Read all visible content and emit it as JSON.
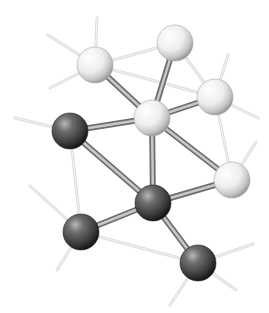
{
  "image": {
    "description": "3D ball-and-stick molecular cluster illustration",
    "background": "#ffffff",
    "caption_cropped": "",
    "atom_colors": {
      "light": "#f2f2f2",
      "dark": "#4a4a4a"
    },
    "bond_color": "#9a9a9a",
    "hint_line_color": "#dcdcdc"
  },
  "atoms": [
    {
      "id": "A",
      "type": "light",
      "x": 95,
      "y": 65,
      "r": 18
    },
    {
      "id": "B",
      "type": "light",
      "x": 175,
      "y": 43,
      "r": 18
    },
    {
      "id": "C",
      "type": "light",
      "x": 215,
      "y": 97,
      "r": 18
    },
    {
      "id": "D",
      "type": "light",
      "x": 152,
      "y": 118,
      "r": 18
    },
    {
      "id": "E",
      "type": "dark",
      "x": 70,
      "y": 131,
      "r": 18
    },
    {
      "id": "F",
      "type": "light",
      "x": 232,
      "y": 180,
      "r": 18
    },
    {
      "id": "G",
      "type": "dark",
      "x": 153,
      "y": 203,
      "r": 18
    },
    {
      "id": "H",
      "type": "dark",
      "x": 81,
      "y": 232,
      "r": 18
    },
    {
      "id": "I",
      "type": "dark",
      "x": 198,
      "y": 263,
      "r": 18
    }
  ],
  "bonds": [
    [
      "A",
      "D"
    ],
    [
      "B",
      "D"
    ],
    [
      "C",
      "D"
    ],
    [
      "E",
      "D"
    ],
    [
      "D",
      "G"
    ],
    [
      "D",
      "F"
    ],
    [
      "E",
      "G"
    ],
    [
      "H",
      "G"
    ],
    [
      "G",
      "F"
    ],
    [
      "G",
      "I"
    ]
  ],
  "hint_lines": [
    [
      "A",
      "B"
    ],
    [
      "A",
      "C"
    ],
    [
      "B",
      "C"
    ],
    [
      "E",
      "H"
    ],
    [
      "H",
      "I"
    ],
    [
      "C",
      "F"
    ]
  ],
  "stub_lines": [
    {
      "from": "A",
      "x": 97,
      "y": 18
    },
    {
      "from": "A",
      "x": 48,
      "y": 35
    },
    {
      "from": "A",
      "x": 50,
      "y": 88
    },
    {
      "from": "C",
      "x": 228,
      "y": 55
    },
    {
      "from": "C",
      "x": 258,
      "y": 118
    },
    {
      "from": "F",
      "x": 256,
      "y": 142
    },
    {
      "from": "E",
      "x": 15,
      "y": 118
    },
    {
      "from": "H",
      "x": 30,
      "y": 186
    },
    {
      "from": "H",
      "x": 57,
      "y": 270
    },
    {
      "from": "I",
      "x": 253,
      "y": 244
    },
    {
      "from": "I",
      "x": 236,
      "y": 290
    },
    {
      "from": "I",
      "x": 170,
      "y": 305
    }
  ]
}
